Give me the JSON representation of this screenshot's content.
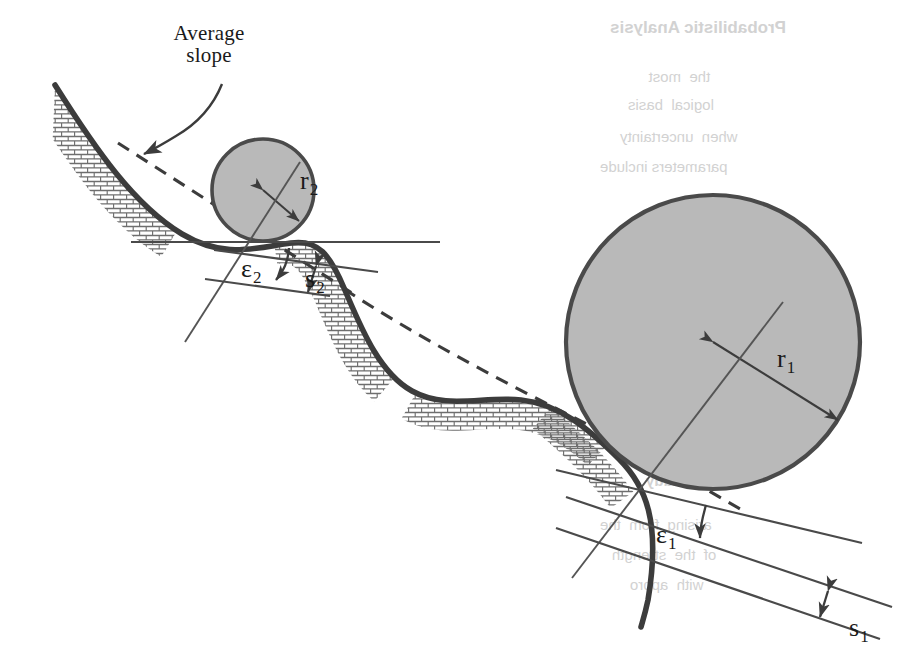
{
  "figure": {
    "kind": "technical-line-diagram",
    "background_color": "#ffffff",
    "ink_color": "#3c3c3c",
    "circle_fill": "#b9b9b9",
    "circle_stroke": "#4a4a4a",
    "hatch_color": "#6e6e6e"
  },
  "callout": {
    "name": "average-slope-callout",
    "line1": "Average",
    "line2": "slope"
  },
  "annotations": {
    "r1": {
      "base": "r",
      "sub": "1",
      "meaning": "radius of large circle"
    },
    "r2": {
      "base": "r",
      "sub": "2",
      "meaning": "radius of small circle"
    },
    "e1": {
      "base": "ε",
      "sub": "1",
      "meaning": "angle between average slope and local tangent at large circle contact"
    },
    "e2": {
      "base": "ε",
      "sub": "2",
      "meaning": "angle between horizontal and local tangent at small circle contact"
    },
    "s1": {
      "base": "s",
      "sub": "1",
      "meaning": "roughness offset at large circle"
    },
    "s2": {
      "base": "s",
      "sub": "2",
      "meaning": "roughness offset at small circle"
    }
  },
  "circles": [
    {
      "name": "large-circle",
      "label": "r1",
      "cx": 713,
      "cy": 342,
      "r": 147
    },
    {
      "name": "small-circle",
      "label": "r2",
      "cx": 263,
      "cy": 190,
      "r": 51
    }
  ],
  "showthrough": [
    {
      "text": "Probabilistic Analysis",
      "x": 610,
      "y": 18,
      "size": 17,
      "weight": "bold"
    },
    {
      "text": "the  most   ",
      "x": 636,
      "y": 68,
      "size": 15,
      "weight": "normal"
    },
    {
      "text": "logical  basis",
      "x": 628,
      "y": 96,
      "size": 15,
      "weight": "normal"
    },
    {
      "text": "when  uncertainty",
      "x": 620,
      "y": 128,
      "size": 15,
      "weight": "normal"
    },
    {
      "text": "parameters include",
      "x": 600,
      "y": 158,
      "size": 15,
      "weight": "normal"
    },
    {
      "text": "A  study",
      "x": 646,
      "y": 472,
      "size": 15,
      "weight": "bold"
    },
    {
      "text": "arising  from  the",
      "x": 600,
      "y": 516,
      "size": 15,
      "weight": "normal"
    },
    {
      "text": "of  the  strength",
      "x": 612,
      "y": 546,
      "size": 15,
      "weight": "normal"
    },
    {
      "text": "with  appro",
      "x": 630,
      "y": 576,
      "size": 15,
      "weight": "normal"
    }
  ]
}
